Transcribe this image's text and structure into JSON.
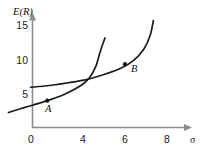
{
  "figure": {
    "background_color": "#ffffff",
    "curve_color": "#1c1c1c",
    "axis_color": "#8d8d8d",
    "text_color": "#111111",
    "y_axis_title": "E(R)",
    "x_axis_title": "σ"
  },
  "chart_data": {
    "type": "line",
    "title": "",
    "subtitle": "",
    "xlabel": "σ",
    "ylabel": "E(R)",
    "xlim": [
      0,
      9
    ],
    "ylim": [
      0,
      17
    ],
    "xticks": [
      "0",
      "4",
      "6",
      "8"
    ],
    "xtick_values": [
      0,
      4,
      6,
      8
    ],
    "yticks": [
      "5",
      "10",
      "15"
    ],
    "ytick_values": [
      5,
      10,
      15
    ],
    "grid": false,
    "legend": "none",
    "series": [
      {
        "name": "curve-steep",
        "x": [
          0.45,
          1.2,
          2.2,
          3.1,
          3.9,
          4.3,
          4.6,
          4.8,
          4.95,
          5.05
        ],
        "y": [
          2.4,
          3.1,
          4.0,
          5.0,
          6.3,
          7.4,
          9.0,
          11.0,
          12.4,
          13.2
        ]
      },
      {
        "name": "curve-flat",
        "x": [
          1.5,
          2.4,
          3.3,
          4.2,
          5.0,
          5.8,
          6.4,
          6.9,
          7.2,
          7.35
        ],
        "y": [
          6.05,
          6.3,
          6.7,
          7.2,
          7.9,
          8.8,
          9.9,
          11.6,
          13.6,
          15.7
        ]
      }
    ],
    "annotations": [
      {
        "label": "A",
        "x": 2.3,
        "y": 4.1,
        "on_series": "curve-steep"
      },
      {
        "label": "B",
        "x": 6.0,
        "y": 9.4,
        "on_series": "curve-flat"
      }
    ]
  },
  "labels": {
    "y_tick_15": "15",
    "y_tick_10": "10",
    "y_tick_5": "5",
    "x_tick_0": "0",
    "x_tick_4": "4",
    "x_tick_6": "6",
    "x_tick_8": "8",
    "point_a": "A",
    "point_b": "B",
    "y_axis_title": "E(R)",
    "x_axis_title": "σ"
  }
}
